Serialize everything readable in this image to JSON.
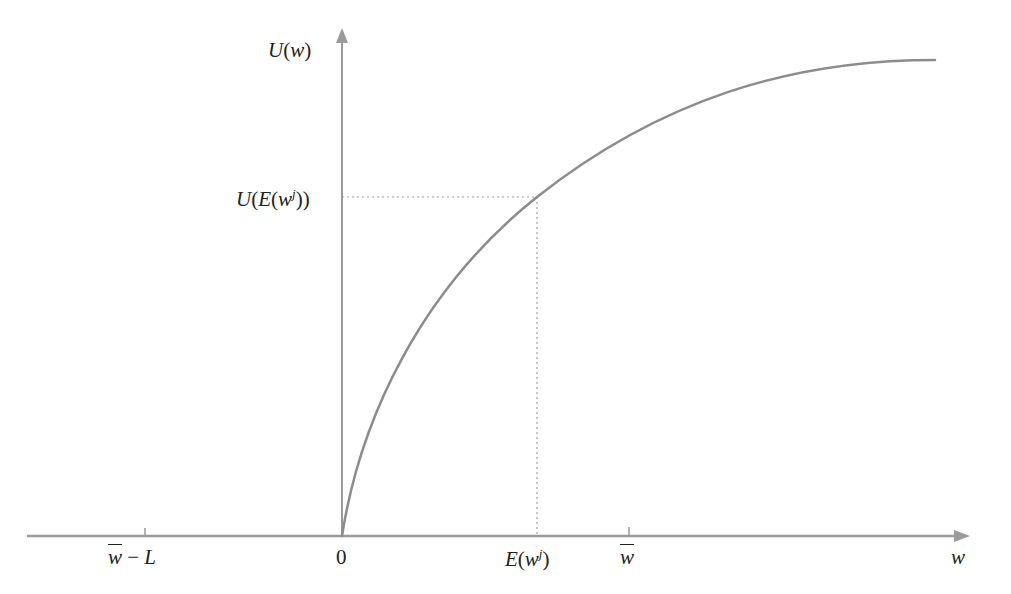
{
  "diagram": {
    "title": "",
    "type": "utility function diagram",
    "colors": {
      "axis": "#9a9a9a",
      "curve": "#8c8c8c",
      "guide": "#a0a0a0",
      "text": "#222222",
      "background": "#ffffff"
    },
    "y_axis": {
      "label_main": "U",
      "label_arg": "(w)",
      "label_full": "U(w)"
    },
    "x_axis": {
      "label": "w",
      "ticks": [
        {
          "id": "w-bar-minus-L",
          "text_w": "w",
          "text_rest": " − L",
          "full": "w̄ − L"
        },
        {
          "id": "zero",
          "text": "0"
        },
        {
          "id": "expected-wealth",
          "text_main": "E(w",
          "text_sup": "j",
          "text_close": ")",
          "full": "E(w^j)"
        },
        {
          "id": "w-bar",
          "text": "w",
          "full": "w̄"
        }
      ]
    },
    "guide_point": {
      "y_label_main": "U(E(w",
      "y_label_sup": "j",
      "y_label_close": "))",
      "y_label_full": "U(E(w^j))",
      "x_label_full": "E(w^j)"
    },
    "curve": {
      "description": "Concave increasing utility curve starting at origin, flat at zero for negative wealth",
      "shape": "concave"
    }
  }
}
